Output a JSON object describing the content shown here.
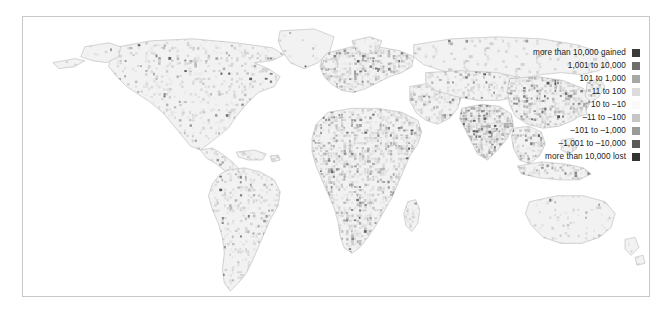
{
  "figure": {
    "background_color": "#ffffff",
    "frame_color": "#c8c8c8",
    "land_base_color": "#f2f2f2",
    "land_outline_color": "#d2d2d2"
  },
  "legend": {
    "name": "population-change-legend",
    "rows": [
      {
        "label": "more than 10,000 gained",
        "color": "#3a3a3a"
      },
      {
        "label": "1,001 to 10,000",
        "color": "#6e6e6e"
      },
      {
        "label": "101 to 1,000",
        "color": "#a8a8a8"
      },
      {
        "label": "11 to 100",
        "color": "#dcdcdc"
      },
      {
        "label": "10 to –10",
        "color": "#fafafa"
      },
      {
        "label": "–11 to –100",
        "color": "#c6c6c6"
      },
      {
        "label": "–101 to –1,000",
        "color": "#9a9a9a"
      },
      {
        "label": "–1,001 to –10,000",
        "color": "#5a5a5a"
      },
      {
        "label": "more than 10,000 lost",
        "color": "#333333"
      }
    ]
  },
  "chart_data": {
    "type": "heatmap",
    "title": "",
    "xlabel": "",
    "ylabel": "",
    "legend_position": "right-inside",
    "grid": false,
    "projection": "world-equal-area",
    "value_unit": "persons gained or lost per grid cell",
    "categories": [
      "more than 10,000 gained",
      "1,001 to 10,000",
      "101 to 1,000",
      "11 to 100",
      "10 to –10",
      "–11 to –100",
      "–101 to –1,000",
      "–1,001 to –10,000",
      "more than 10,000 lost"
    ],
    "category_colors": [
      "#3a3a3a",
      "#6e6e6e",
      "#a8a8a8",
      "#dcdcdc",
      "#fafafa",
      "#c6c6c6",
      "#9a9a9a",
      "#5a5a5a",
      "#333333"
    ],
    "regions": [
      {
        "name": "North America",
        "dominant_category": "11 to 100",
        "density": 0.22,
        "darkness": 0.2
      },
      {
        "name": "Central America",
        "dominant_category": "101 to 1,000",
        "density": 0.4,
        "darkness": 0.38
      },
      {
        "name": "South America",
        "dominant_category": "11 to 100",
        "density": 0.28,
        "darkness": 0.26
      },
      {
        "name": "Europe",
        "dominant_category": "101 to 1,000",
        "density": 0.55,
        "darkness": 0.45
      },
      {
        "name": "Africa",
        "dominant_category": "101 to 1,000",
        "density": 0.5,
        "darkness": 0.44
      },
      {
        "name": "Middle East",
        "dominant_category": "101 to 1,000",
        "density": 0.45,
        "darkness": 0.4
      },
      {
        "name": "South Asia",
        "dominant_category": "more than 10,000 gained",
        "density": 0.8,
        "darkness": 0.78
      },
      {
        "name": "East Asia",
        "dominant_category": "1,001 to 10,000",
        "density": 0.62,
        "darkness": 0.55
      },
      {
        "name": "Southeast Asia",
        "dominant_category": "1,001 to 10,000",
        "density": 0.48,
        "darkness": 0.44
      },
      {
        "name": "Northern Asia / Siberia",
        "dominant_category": "11 to 100",
        "density": 0.18,
        "darkness": 0.18
      },
      {
        "name": "Australia & New Zealand",
        "dominant_category": "10 to –10",
        "density": 0.12,
        "darkness": 0.12
      }
    ],
    "landmasses": [
      {
        "name": "north-america",
        "density": 0.22,
        "darkness": 0.2,
        "seed": 11,
        "path": "M96,30 L128,24 L170,22 L214,26 L250,31 L262,38 L250,44 L232,46 L246,52 L258,60 L252,70 L236,76 L224,88 L214,100 L206,112 L196,120 L186,128 L178,134 L168,130 L160,120 L150,108 L140,96 L128,86 L116,78 L104,70 L94,60 L86,50 L88,40 Z"
      },
      {
        "name": "alaska-aleutians",
        "density": 0.1,
        "darkness": 0.14,
        "seed": 23,
        "path": "M62,30 L86,26 L98,30 L96,40 L84,46 L70,44 L58,40 Z M30,46 L52,42 L62,44 L52,50 L36,52 Z"
      },
      {
        "name": "greenland",
        "density": 0.06,
        "darkness": 0.12,
        "seed": 31,
        "path": "M258,14 L292,12 L312,20 L308,34 L296,46 L282,52 L268,46 L260,34 L256,24 Z"
      },
      {
        "name": "central-america",
        "density": 0.4,
        "darkness": 0.38,
        "seed": 37,
        "path": "M178,134 L190,132 L200,138 L210,146 L218,154 L214,160 L204,156 L194,148 L184,142 Z"
      },
      {
        "name": "caribbean",
        "density": 0.32,
        "darkness": 0.34,
        "seed": 41,
        "path": "M214,136 L232,134 L244,138 L240,144 L226,144 L216,141 Z M248,140 L256,139 L258,144 L250,146 Z"
      },
      {
        "name": "south-america",
        "density": 0.28,
        "darkness": 0.26,
        "seed": 47,
        "path": "M206,154 L222,152 L238,156 L252,164 L258,176 L256,190 L248,204 L242,218 L236,232 L230,246 L224,258 L216,268 L208,276 L202,268 L200,254 L202,238 L200,222 L196,208 L190,194 L186,180 L190,168 L198,158 Z"
      },
      {
        "name": "europe",
        "density": 0.55,
        "darkness": 0.45,
        "seed": 53,
        "path": "M306,36 L330,30 L356,30 L378,34 L392,40 L390,50 L380,56 L368,60 L356,66 L344,72 L332,76 L320,74 L310,68 L302,60 L298,50 L300,42 Z"
      },
      {
        "name": "scandinavia-uk",
        "density": 0.38,
        "darkness": 0.34,
        "seed": 59,
        "path": "M330,24 L348,20 L360,24 L356,34 L344,38 L334,34 Z M302,44 L314,42 L316,50 L306,54 L300,50 Z"
      },
      {
        "name": "africa",
        "density": 0.5,
        "darkness": 0.44,
        "seed": 61,
        "path": "M306,96 L330,92 L356,92 L380,96 L396,104 L400,116 L396,128 L388,140 L382,154 L376,168 L370,182 L362,196 L354,210 L346,222 L338,232 L330,238 L322,232 L318,220 L316,206 L312,192 L306,178 L300,164 L294,150 L290,136 L290,122 L294,108 Z"
      },
      {
        "name": "madagascar",
        "density": 0.3,
        "darkness": 0.3,
        "seed": 67,
        "path": "M386,186 L394,184 L398,194 L396,208 L390,216 L384,210 L382,198 Z"
      },
      {
        "name": "middle-east",
        "density": 0.45,
        "darkness": 0.4,
        "seed": 71,
        "path": "M388,70 L412,66 L432,70 L440,80 L436,92 L428,102 L416,108 L404,104 L394,96 L388,84 Z"
      },
      {
        "name": "northern-asia",
        "density": 0.18,
        "darkness": 0.18,
        "seed": 73,
        "path": "M392,28 L430,22 L476,20 L520,22 L556,28 L580,36 L588,46 L578,54 L560,58 L540,56 L520,58 L500,62 L480,64 L460,62 L440,58 L420,54 L402,48 L392,40 Z"
      },
      {
        "name": "central-asia",
        "density": 0.34,
        "darkness": 0.34,
        "seed": 79,
        "path": "M404,56 L440,54 L476,56 L502,62 L508,72 L498,80 L478,84 L456,84 L434,80 L414,74 L404,66 Z"
      },
      {
        "name": "south-asia",
        "density": 0.8,
        "darkness": 0.78,
        "seed": 83,
        "path": "M440,92 L460,88 L478,90 L490,98 L492,110 L486,122 L476,134 L466,144 L456,138 L450,126 L444,114 L438,102 Z"
      },
      {
        "name": "east-asia",
        "density": 0.62,
        "darkness": 0.55,
        "seed": 89,
        "path": "M488,62 L516,60 L542,64 L562,72 L570,84 L564,96 L552,104 L538,110 L522,112 L506,108 L494,100 L488,88 L486,74 Z"
      },
      {
        "name": "japan-korea",
        "density": 0.44,
        "darkness": 0.42,
        "seed": 97,
        "path": "M566,66 L578,62 L584,70 L578,80 L570,86 L564,80 Z M556,92 L564,90 L566,98 L558,100 Z"
      },
      {
        "name": "southeast-asia",
        "density": 0.48,
        "darkness": 0.44,
        "seed": 101,
        "path": "M492,112 L508,110 L520,116 L524,128 L518,140 L508,148 L498,144 L492,132 L490,120 Z"
      },
      {
        "name": "indonesia-philippines",
        "density": 0.42,
        "darkness": 0.4,
        "seed": 103,
        "path": "M496,150 L520,146 L544,148 L562,152 L570,158 L558,164 L538,164 L518,162 L500,158 Z M540,124 L552,122 L556,132 L548,138 L540,134 Z"
      },
      {
        "name": "australia",
        "density": 0.12,
        "darkness": 0.12,
        "seed": 107,
        "path": "M508,186 L536,180 L562,180 L584,186 L594,198 L590,212 L578,222 L560,228 L540,228 L522,222 L510,210 L504,198 Z"
      },
      {
        "name": "new-zealand",
        "density": 0.1,
        "darkness": 0.12,
        "seed": 109,
        "path": "M604,224 L614,222 L618,232 L610,240 L604,234 Z M614,242 L622,240 L624,248 L616,250 Z"
      }
    ]
  }
}
